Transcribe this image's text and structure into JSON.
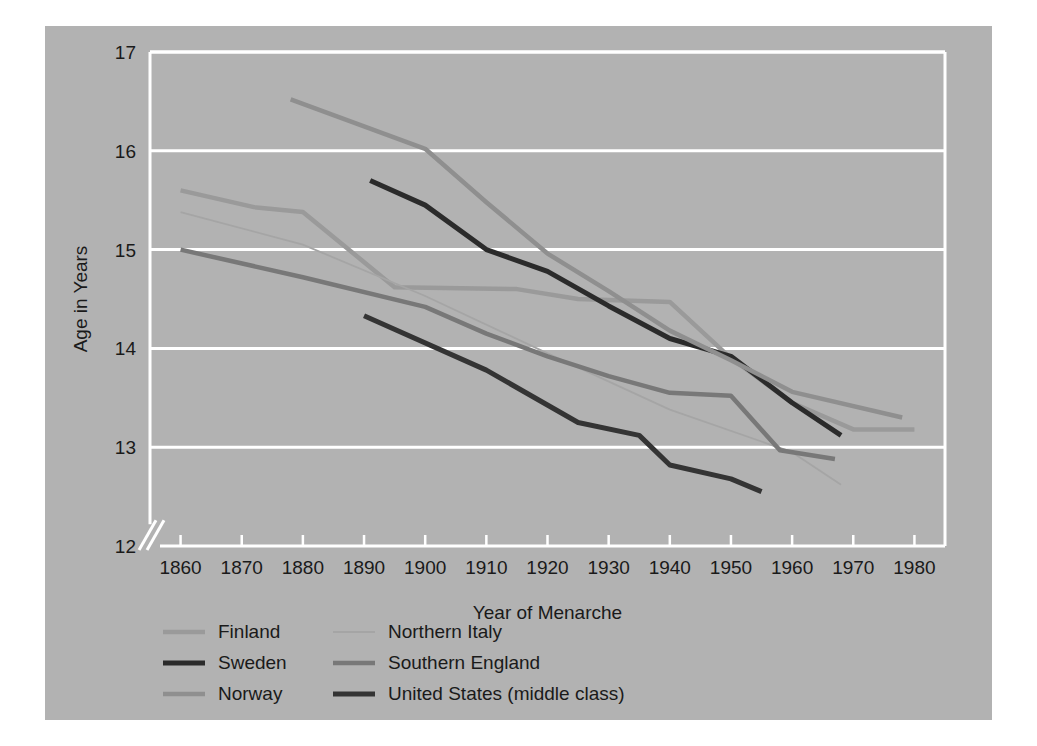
{
  "chart_data": {
    "type": "line",
    "title": "",
    "xlabel": "Year of Menarche",
    "ylabel": "Age in Years",
    "xlim": [
      1855,
      1985
    ],
    "ylim": [
      12,
      17
    ],
    "xticks": [
      1860,
      1870,
      1880,
      1890,
      1900,
      1910,
      1920,
      1930,
      1940,
      1950,
      1960,
      1970,
      1980
    ],
    "yticks": [
      12,
      13,
      14,
      15,
      16,
      17
    ],
    "grid": "horizontal",
    "axis_break": true,
    "legend_position": "below-left",
    "legend_columns": 2,
    "series": [
      {
        "name": "Finland",
        "color": "#9a9a9a",
        "width": 4.5,
        "points": [
          [
            1860,
            15.6
          ],
          [
            1872,
            15.43
          ],
          [
            1880,
            15.38
          ],
          [
            1895,
            14.62
          ],
          [
            1915,
            14.6
          ],
          [
            1925,
            14.5
          ],
          [
            1940,
            14.47
          ],
          [
            1950,
            13.9
          ],
          [
            1960,
            13.45
          ],
          [
            1970,
            13.18
          ],
          [
            1980,
            13.18
          ]
        ]
      },
      {
        "name": "Sweden",
        "color": "#2b2b2b",
        "width": 5.0,
        "points": [
          [
            1891,
            15.7
          ],
          [
            1900,
            15.45
          ],
          [
            1910,
            15.0
          ],
          [
            1920,
            14.78
          ],
          [
            1930,
            14.43
          ],
          [
            1940,
            14.1
          ],
          [
            1950,
            13.92
          ],
          [
            1960,
            13.45
          ],
          [
            1968,
            13.12
          ]
        ]
      },
      {
        "name": "Norway",
        "color": "#8f8f8f",
        "width": 4.5,
        "points": [
          [
            1878,
            16.52
          ],
          [
            1900,
            16.02
          ],
          [
            1910,
            15.48
          ],
          [
            1920,
            14.96
          ],
          [
            1930,
            14.58
          ],
          [
            1940,
            14.18
          ],
          [
            1950,
            13.88
          ],
          [
            1960,
            13.56
          ],
          [
            1978,
            13.3
          ]
        ]
      },
      {
        "name": "Northern Italy",
        "color": "#a5a5a5",
        "width": 1.8,
        "points": [
          [
            1860,
            15.38
          ],
          [
            1880,
            15.05
          ],
          [
            1900,
            14.53
          ],
          [
            1920,
            13.95
          ],
          [
            1940,
            13.38
          ],
          [
            1960,
            12.95
          ],
          [
            1968,
            12.62
          ]
        ]
      },
      {
        "name": "Southern England",
        "color": "#787878",
        "width": 4.5,
        "points": [
          [
            1860,
            15.0
          ],
          [
            1880,
            14.72
          ],
          [
            1900,
            14.42
          ],
          [
            1910,
            14.15
          ],
          [
            1920,
            13.92
          ],
          [
            1930,
            13.72
          ],
          [
            1940,
            13.55
          ],
          [
            1950,
            13.52
          ],
          [
            1958,
            12.97
          ],
          [
            1967,
            12.88
          ]
        ]
      },
      {
        "name": "United States (middle class)",
        "color": "#343434",
        "width": 5.0,
        "points": [
          [
            1890,
            14.33
          ],
          [
            1910,
            13.78
          ],
          [
            1925,
            13.25
          ],
          [
            1935,
            13.12
          ],
          [
            1940,
            12.82
          ],
          [
            1950,
            12.68
          ],
          [
            1955,
            12.55
          ]
        ]
      }
    ]
  },
  "axes": {
    "ylabel": "Age in Years",
    "xlabel": "Year of Menarche",
    "xtick_labels": [
      "1860",
      "1870",
      "1880",
      "1890",
      "1900",
      "1910",
      "1920",
      "1930",
      "1940",
      "1950",
      "1960",
      "1970",
      "1980"
    ],
    "ytick_labels": [
      "12",
      "13",
      "14",
      "15",
      "16",
      "17"
    ]
  },
  "legend": {
    "entries": [
      {
        "label": "Finland",
        "color": "#9a9a9a",
        "width": 4.5
      },
      {
        "label": "Northern Italy",
        "color": "#a5a5a5",
        "width": 1.8
      },
      {
        "label": "Sweden",
        "color": "#2b2b2b",
        "width": 5.0
      },
      {
        "label": "Southern England",
        "color": "#787878",
        "width": 4.5
      },
      {
        "label": "Norway",
        "color": "#8f8f8f",
        "width": 4.5
      },
      {
        "label": "United States (middle class)",
        "color": "#343434",
        "width": 5.0
      }
    ]
  },
  "colors": {
    "figure_background": "#b2b2b2",
    "page_background": "#ffffff",
    "gridline": "#ffffff",
    "axis": "#ffffff",
    "text": "#1a1a1a"
  }
}
